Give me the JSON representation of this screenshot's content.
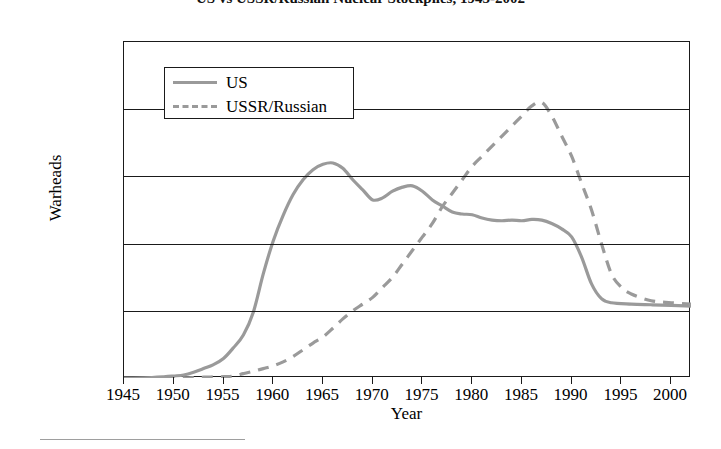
{
  "chart_data": {
    "type": "line",
    "title": "US vs USSR/Russian Nuclear Stockpiles, 1945-2002",
    "xlabel": "Year",
    "ylabel": "Warheads",
    "xlim": [
      1945,
      2002
    ],
    "ylim": [
      0,
      50000
    ],
    "grid": true,
    "legend_position": "top-left-inside",
    "xticks": [
      1945,
      1950,
      1955,
      1960,
      1965,
      1970,
      1975,
      1980,
      1985,
      1990,
      1995,
      2000
    ],
    "xtick_labels": [
      "1945",
      "1950",
      "1955",
      "1960",
      "1965",
      "1970",
      "1975",
      "1980",
      "1985",
      "1990",
      "1995",
      "2000"
    ],
    "yticks": [
      0,
      10000,
      20000,
      30000,
      40000,
      50000
    ],
    "ytick_labels": [
      "0",
      "10,000",
      "20,000",
      "30,000",
      "40,000",
      "50,000"
    ],
    "series": [
      {
        "name": "US",
        "style": "solid",
        "color": "#9a9a9a",
        "x": [
          1945,
          1947,
          1949,
          1950,
          1951,
          1952,
          1953,
          1954,
          1955,
          1956,
          1957,
          1958,
          1959,
          1960,
          1961,
          1962,
          1963,
          1964,
          1965,
          1966,
          1967,
          1968,
          1969,
          1970,
          1971,
          1972,
          1973,
          1974,
          1975,
          1976,
          1977,
          1978,
          1979,
          1980,
          1981,
          1982,
          1983,
          1984,
          1985,
          1986,
          1987,
          1988,
          1989,
          1990,
          1991,
          1992,
          1993,
          1994,
          1996,
          1998,
          2000,
          2002
        ],
        "values": [
          2,
          30,
          180,
          300,
          450,
          850,
          1400,
          2000,
          2900,
          4500,
          6400,
          9800,
          15500,
          20400,
          24200,
          27300,
          29500,
          31000,
          31800,
          32000,
          31200,
          29500,
          28000,
          26500,
          26800,
          27800,
          28400,
          28600,
          27800,
          26500,
          25600,
          24700,
          24400,
          24300,
          23800,
          23500,
          23400,
          23500,
          23400,
          23600,
          23500,
          23000,
          22200,
          21000,
          18000,
          14000,
          11800,
          11200,
          11000,
          10900,
          10800,
          10700
        ]
      },
      {
        "name": "USSR/Russian",
        "style": "dashed",
        "color": "#9a9a9a",
        "x": [
          1949,
          1951,
          1953,
          1955,
          1956,
          1957,
          1958,
          1959,
          1960,
          1961,
          1962,
          1963,
          1964,
          1965,
          1966,
          1967,
          1968,
          1969,
          1970,
          1971,
          1972,
          1973,
          1974,
          1975,
          1976,
          1977,
          1978,
          1979,
          1980,
          1981,
          1982,
          1983,
          1984,
          1985,
          1986,
          1987,
          1988,
          1989,
          1990,
          1991,
          1992,
          1993,
          1994,
          1995,
          1996,
          1998,
          2000,
          2002
        ],
        "values": [
          1,
          25,
          120,
          200,
          300,
          650,
          1000,
          1400,
          1800,
          2400,
          3200,
          4200,
          5200,
          6100,
          7400,
          8800,
          10000,
          11000,
          12000,
          13500,
          15000,
          17000,
          19000,
          21000,
          23000,
          25500,
          27500,
          29500,
          31500,
          33000,
          34500,
          36000,
          37500,
          39000,
          40500,
          41000,
          39000,
          36000,
          33000,
          29000,
          25000,
          20000,
          15500,
          13500,
          12500,
          11500,
          11200,
          11000
        ]
      }
    ],
    "annotations": {
      "us_peak_year": 1966,
      "us_peak_value": 32000,
      "ussr_peak_year": 1987,
      "ussr_peak_value": 41000,
      "crossover_year": 1978
    }
  },
  "legend": {
    "items": [
      {
        "label": "US",
        "style": "solid"
      },
      {
        "label": "USSR/Russian",
        "style": "dashed"
      }
    ]
  },
  "colors": {
    "line": "#9a9a9a",
    "axis": "#1a1a1a",
    "background": "#ffffff"
  }
}
